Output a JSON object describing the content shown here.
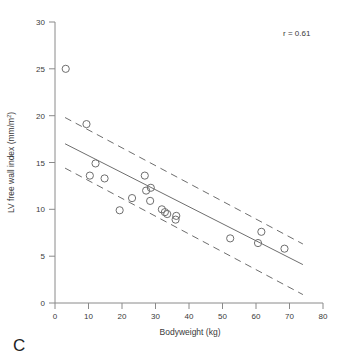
{
  "panel": {
    "label": "C"
  },
  "annotation": {
    "correlation_label": "r = 0.61"
  },
  "axes": {
    "x_title": "Bodyweight (kg)",
    "y_title_main": "LV free wall index (mm/m",
    "y_title_sup": "2",
    "y_title_close": ")",
    "x_ticks": [
      "0",
      "10",
      "20",
      "30",
      "40",
      "50",
      "60",
      "70",
      "80"
    ],
    "y_ticks": [
      "0",
      "5",
      "10",
      "15",
      "20",
      "25",
      "30"
    ]
  },
  "colors": {
    "axis": "#8a8a8a",
    "marker": "#6e6e6e",
    "line": "#6e6e6e",
    "text": "#3a3a3a",
    "background": "#ffffff"
  },
  "chart_data": {
    "type": "scatter",
    "title": "",
    "xlabel": "Bodyweight (kg)",
    "ylabel": "LV free wall index (mm/m2)",
    "xlim": [
      0,
      80
    ],
    "ylim": [
      0,
      30
    ],
    "xticks": [
      0,
      10,
      20,
      30,
      40,
      50,
      60,
      70,
      80
    ],
    "yticks": [
      0,
      5,
      10,
      15,
      20,
      25,
      30
    ],
    "grid": false,
    "legend": null,
    "annotations": [
      {
        "text": "r = 0.61",
        "x": 62,
        "y": 28.3
      },
      {
        "text": "C",
        "x": 2,
        "y": -5.5
      }
    ],
    "points": [
      {
        "x": 3.2,
        "y": 25.0
      },
      {
        "x": 9.4,
        "y": 19.1
      },
      {
        "x": 12.1,
        "y": 14.9
      },
      {
        "x": 10.4,
        "y": 13.6
      },
      {
        "x": 14.8,
        "y": 13.3
      },
      {
        "x": 19.3,
        "y": 9.9
      },
      {
        "x": 23.0,
        "y": 11.2
      },
      {
        "x": 26.8,
        "y": 13.6
      },
      {
        "x": 27.2,
        "y": 12.0
      },
      {
        "x": 28.6,
        "y": 12.3
      },
      {
        "x": 28.4,
        "y": 10.9
      },
      {
        "x": 31.9,
        "y": 10.0
      },
      {
        "x": 32.8,
        "y": 9.7
      },
      {
        "x": 33.5,
        "y": 9.5
      },
      {
        "x": 36.2,
        "y": 9.3
      },
      {
        "x": 36.0,
        "y": 8.9
      },
      {
        "x": 52.3,
        "y": 6.9
      },
      {
        "x": 60.6,
        "y": 6.4
      },
      {
        "x": 61.6,
        "y": 7.6
      },
      {
        "x": 68.5,
        "y": 5.8
      }
    ],
    "fit_line": {
      "style": "solid",
      "x": [
        3.0,
        74.0
      ],
      "y": [
        17.0,
        4.1
      ]
    },
    "confidence_band": {
      "style": "dashed",
      "upper": {
        "x": [
          3.0,
          74.0
        ],
        "y": [
          19.8,
          6.3
        ]
      },
      "lower": {
        "x": [
          3.0,
          74.0
        ],
        "y": [
          14.4,
          0.9
        ]
      }
    }
  }
}
